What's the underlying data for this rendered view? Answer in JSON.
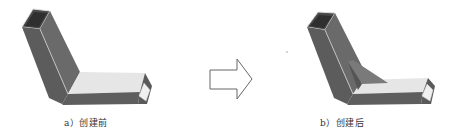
{
  "figure": {
    "panels": [
      {
        "id": "a",
        "caption": "a）创建前",
        "state": "before"
      },
      {
        "id": "b",
        "caption": "b）创建后",
        "state": "after"
      }
    ],
    "arrow": {
      "direction": "right",
      "icon": "hollow-arrow-right-icon"
    },
    "colors": {
      "tube_dark": "#5a5a5a",
      "tube_mid": "#6e6e6e",
      "tube_light": "#e4e4e4",
      "edge_highlight": "#d8d8d8",
      "arrow_stroke": "#666666",
      "background": "#ffffff"
    }
  }
}
